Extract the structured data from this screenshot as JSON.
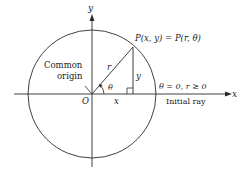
{
  "diagram": {
    "type": "polar-coordinates-figure",
    "axes": {
      "x_label": "x",
      "y_label": "y"
    },
    "origin_label": "O",
    "point_label": "P(x, y) = P(r, θ)",
    "radius_label": "r",
    "angle_label": "θ",
    "leg_x_label": "x",
    "leg_y_label": "y",
    "common_origin_line1": "Common",
    "common_origin_line2": "origin",
    "initial_ray_condition": "θ = 0, r ≥ 0",
    "initial_ray_label": "Initial ray",
    "colors": {
      "line": "#2a2a2a",
      "text": "#222222",
      "background": "#ffffff"
    }
  }
}
